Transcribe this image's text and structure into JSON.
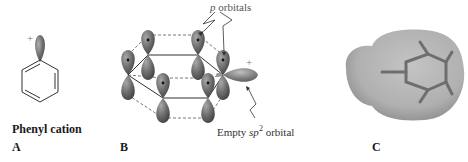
{
  "figure": {
    "panel_a": {
      "caption": "Phenyl cation",
      "letter": "A",
      "charge": "+"
    },
    "panel_b": {
      "letter": "B",
      "label_p_orbitals_italic": "p",
      "label_p_orbitals_rest": " orbitals",
      "label_empty_prefix": "Empty ",
      "label_empty_italic": "sp",
      "label_empty_sup": "2",
      "label_empty_suffix": " orbital",
      "charge": "+"
    },
    "panel_c": {
      "letter": "C"
    },
    "colors": {
      "orbital_fill": "#6e6e6e",
      "orbital_highlight": "#a8a8a8",
      "bond_line": "#333333",
      "label_gray": "#555555",
      "surface_fill": "#b5b5b5",
      "surface_shadow": "#8c8c8c"
    }
  }
}
